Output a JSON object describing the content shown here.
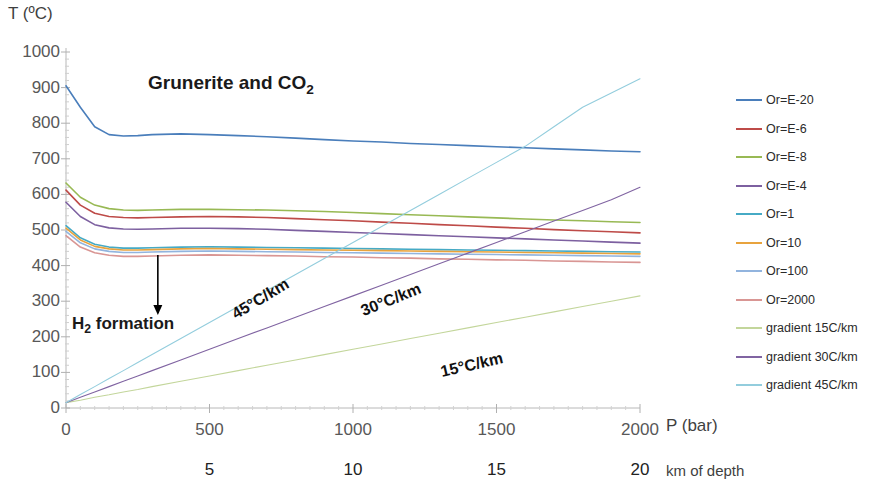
{
  "chart_data": {
    "type": "line",
    "title": "",
    "xlabel": "P (bar)",
    "ylabel": "T (ºC)",
    "secondary_xlabel": "km of depth",
    "xlim": [
      0,
      2000
    ],
    "ylim": [
      0,
      1000
    ],
    "xticks": [
      0,
      500,
      1000,
      1500,
      2000
    ],
    "yticks": [
      0,
      100,
      200,
      300,
      400,
      500,
      600,
      700,
      800,
      900,
      1000
    ],
    "secondary_xticks": [
      5,
      10,
      15,
      20
    ],
    "secondary_xtick_positions": [
      500,
      1000,
      1500,
      2000
    ],
    "grid": false,
    "legend_position": "right",
    "annotations": [
      {
        "text": "Grunerite and CO₂",
        "x": 560,
        "y": 880
      },
      {
        "text": "H₂ formation",
        "x": 110,
        "y": 200
      },
      {
        "text": "45°C/km",
        "x": 620,
        "y": 300
      },
      {
        "text": "30°C/km",
        "x": 1180,
        "y": 300
      },
      {
        "text": "15°C/km",
        "x": 1500,
        "y": 205
      }
    ],
    "arrow": {
      "x": 320,
      "y_from": 430,
      "y_to": 270
    },
    "x": [
      0,
      50,
      100,
      150,
      200,
      250,
      300,
      400,
      500,
      600,
      700,
      800,
      900,
      1000,
      1100,
      1200,
      1300,
      1400,
      1500,
      1600,
      1700,
      1800,
      1900,
      2000
    ],
    "series": [
      {
        "name": "Or=E-20",
        "color": "#4A7EBB",
        "values": [
          905,
          845,
          790,
          768,
          764,
          765,
          768,
          770,
          768,
          765,
          762,
          758,
          754,
          750,
          747,
          743,
          740,
          737,
          734,
          731,
          728,
          725,
          722,
          720
        ]
      },
      {
        "name": "Or=E-6",
        "color": "#BE4B48",
        "values": [
          612,
          570,
          547,
          538,
          535,
          534,
          535,
          537,
          538,
          537,
          535,
          532,
          529,
          526,
          522,
          519,
          515,
          512,
          508,
          505,
          501,
          498,
          495,
          492
        ]
      },
      {
        "name": "Or=E-8",
        "color": "#98B954",
        "values": [
          632,
          592,
          570,
          560,
          556,
          555,
          556,
          558,
          558,
          557,
          556,
          554,
          552,
          549,
          546,
          543,
          540,
          537,
          534,
          531,
          528,
          526,
          523,
          521
        ]
      },
      {
        "name": "Or=E-4",
        "color": "#7D60A0",
        "values": [
          578,
          538,
          515,
          506,
          503,
          502,
          503,
          505,
          505,
          504,
          502,
          499,
          496,
          493,
          490,
          487,
          484,
          481,
          478,
          475,
          472,
          469,
          466,
          463
        ]
      },
      {
        "name": "Or=1",
        "color": "#46AAC5",
        "values": [
          512,
          478,
          460,
          452,
          449,
          449,
          450,
          452,
          453,
          452,
          451,
          450,
          449,
          448,
          447,
          446,
          445,
          444,
          443,
          442,
          441,
          440,
          439,
          438
        ]
      },
      {
        "name": "Or=10",
        "color": "#E8A33D",
        "values": [
          505,
          472,
          454,
          447,
          444,
          444,
          445,
          447,
          448,
          447,
          446,
          445,
          444,
          443,
          442,
          441,
          440,
          439,
          438,
          437,
          436,
          435,
          434,
          433
        ]
      },
      {
        "name": "Or=100",
        "color": "#92B4DE",
        "values": [
          496,
          464,
          447,
          440,
          437,
          437,
          438,
          440,
          441,
          440,
          439,
          438,
          437,
          436,
          435,
          434,
          433,
          432,
          431,
          430,
          429,
          428,
          427,
          426
        ]
      },
      {
        "name": "Or=2000",
        "color": "#D99694",
        "values": [
          484,
          452,
          436,
          429,
          426,
          426,
          427,
          429,
          430,
          429,
          428,
          427,
          425,
          424,
          422,
          421,
          419,
          418,
          416,
          415,
          413,
          412,
          410,
          409
        ]
      },
      {
        "name": "gradient 15C/km",
        "color": "#C3D69B",
        "values": [
          15,
          22,
          30,
          37,
          45,
          52,
          60,
          75,
          90,
          105,
          120,
          135,
          150,
          165,
          180,
          195,
          210,
          225,
          240,
          255,
          270,
          285,
          300,
          315
        ]
      },
      {
        "name": "gradient 30C/km",
        "color": "#8064A2",
        "values": [
          15,
          30,
          45,
          60,
          75,
          90,
          105,
          135,
          165,
          195,
          225,
          255,
          285,
          315,
          345,
          375,
          405,
          435,
          465,
          495,
          525,
          555,
          585,
          620
        ]
      },
      {
        "name": "gradient 45C/km",
        "color": "#93CDDD",
        "values": [
          15,
          38,
          60,
          83,
          105,
          128,
          150,
          195,
          240,
          285,
          330,
          375,
          420,
          465,
          510,
          555,
          600,
          645,
          690,
          735,
          790,
          845,
          885,
          925
        ]
      }
    ]
  },
  "legend": {
    "items": [
      {
        "label": "Or=E-20"
      },
      {
        "label": "Or=E-6"
      },
      {
        "label": "Or=E-8"
      },
      {
        "label": "Or=E-4"
      },
      {
        "label": "Or=1"
      },
      {
        "label": "Or=10"
      },
      {
        "label": "Or=100"
      },
      {
        "label": "Or=2000"
      },
      {
        "label": "gradient 15C/km"
      },
      {
        "label": "gradient 30C/km"
      },
      {
        "label": "gradient 45C/km"
      }
    ]
  }
}
